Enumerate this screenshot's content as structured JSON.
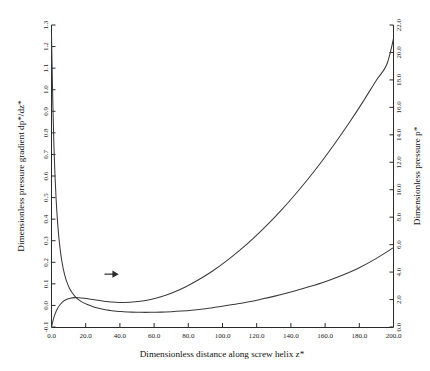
{
  "chart_data": {
    "type": "line",
    "title": "",
    "xlabel": "Dimensionless distance along screw helix  z*",
    "ylabel_left": "Dimensionless pressure gradient  dp*/dz*",
    "ylabel_right": "Dimensionless pressure  p*",
    "xlim": [
      0.0,
      200.0
    ],
    "ylim_left": [
      -0.1,
      1.3
    ],
    "ylim_right": [
      0.0,
      22.0
    ],
    "xticks": [
      "0.0",
      "20.0",
      "40.0",
      "60.0",
      "80.0",
      "100.0",
      "120.0",
      "140.0",
      "160.0",
      "180.0",
      "200.0"
    ],
    "xtick_values": [
      0,
      20,
      40,
      60,
      80,
      100,
      120,
      140,
      160,
      180,
      200
    ],
    "yticks_left": [
      "-0.1",
      "0.0",
      "0.1",
      "0.2",
      "0.3",
      "0.4",
      "0.5",
      "0.6",
      "0.7",
      "0.8",
      "0.9",
      "1.0",
      "1.1",
      "1.2",
      "1.3"
    ],
    "ytick_values_left": [
      -0.1,
      0.0,
      0.1,
      0.2,
      0.3,
      0.4,
      0.5,
      0.6,
      0.7,
      0.8,
      0.9,
      1.0,
      1.1,
      1.2,
      1.3
    ],
    "yticks_right": [
      "0.0",
      "2.0",
      "4.0",
      "6.0",
      "8.0",
      "10.0",
      "12.0",
      "14.0",
      "16.0",
      "18.0",
      "20.0",
      "22.0"
    ],
    "ytick_values_right": [
      0,
      2,
      4,
      6,
      8,
      10,
      12,
      14,
      16,
      18,
      20,
      22
    ],
    "grid": false,
    "legend": "none",
    "annotations": [
      {
        "name": "arrow-to-right-axis",
        "type": "arrow",
        "x": 31.0,
        "y_left": 0.145,
        "direction": "right",
        "label": ""
      }
    ],
    "series": [
      {
        "name": "Dimensionless pressure gradient dp*/dz*",
        "axis": "left",
        "x": [
          0.0,
          0.4,
          0.9,
          1.4,
          2.0,
          2.7,
          3.5,
          4.4,
          5.4,
          6.5,
          7.7,
          9.0,
          10.5,
          12.0,
          14.0,
          16.0,
          18.5,
          21.0,
          24.0,
          27.0,
          30.0,
          34.0,
          38.0,
          42.0,
          47.0,
          52.0,
          58.0,
          64.0,
          70.0,
          76.0,
          82.0,
          90.0,
          98.0,
          106.0,
          114.0,
          122.0,
          130.0,
          140.0,
          150.0,
          160.0,
          170.0,
          180.0,
          190.0,
          200.0
        ],
        "y": [
          1.255,
          1.085,
          0.9,
          0.745,
          0.61,
          0.492,
          0.392,
          0.308,
          0.24,
          0.185,
          0.142,
          0.108,
          0.08,
          0.06,
          0.04,
          0.026,
          0.013,
          0.004,
          -0.005,
          -0.012,
          -0.018,
          -0.023,
          -0.027,
          -0.029,
          -0.031,
          -0.032,
          -0.032,
          -0.031,
          -0.029,
          -0.026,
          -0.022,
          -0.015,
          -0.006,
          0.004,
          0.015,
          0.028,
          0.042,
          0.062,
          0.085,
          0.11,
          0.14,
          0.175,
          0.218,
          0.268
        ]
      },
      {
        "name": "Dimensionless pressure p*",
        "axis": "right",
        "x": [
          0.0,
          1.0,
          2.0,
          3.5,
          5.0,
          7.0,
          9.0,
          11.0,
          13.5,
          16.0,
          19.0,
          22.0,
          26.0,
          30.0,
          35.0,
          40.0,
          46.0,
          52.0,
          58.0,
          64.0,
          70.0,
          78.0,
          86.0,
          94.0,
          102.0,
          110.0,
          118.0,
          126.0,
          134.0,
          142.0,
          150.0,
          158.0,
          166.0,
          174.0,
          182.0,
          190.0,
          196.0,
          200.0
        ],
        "y": [
          0.0,
          0.52,
          0.92,
          1.34,
          1.62,
          1.88,
          2.02,
          2.1,
          2.14,
          2.13,
          2.09,
          2.04,
          1.96,
          1.89,
          1.82,
          1.79,
          1.8,
          1.87,
          2.0,
          2.2,
          2.46,
          2.9,
          3.44,
          4.06,
          4.78,
          5.58,
          6.46,
          7.42,
          8.46,
          9.58,
          10.78,
          12.06,
          13.42,
          14.86,
          16.38,
          17.98,
          19.1,
          21.0
        ]
      }
    ]
  }
}
